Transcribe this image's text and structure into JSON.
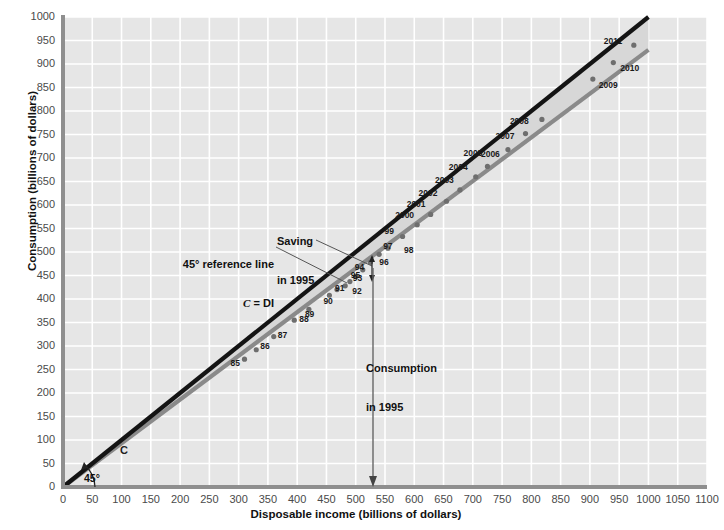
{
  "chart_data": {
    "type": "scatter",
    "title": "",
    "xlabel": "Disposable income (billions of dollars)",
    "ylabel": "Consumption (billions of dollars)",
    "xlim": [
      0,
      1100
    ],
    "ylim": [
      0,
      1000
    ],
    "xticks": [
      0,
      50,
      100,
      150,
      200,
      250,
      300,
      350,
      400,
      450,
      500,
      550,
      600,
      650,
      700,
      750,
      800,
      850,
      900,
      950,
      1000,
      1050,
      1100
    ],
    "yticks": [
      0,
      50,
      100,
      150,
      200,
      250,
      300,
      350,
      400,
      450,
      500,
      550,
      600,
      650,
      700,
      750,
      800,
      850,
      900,
      950,
      1000
    ],
    "grid": true,
    "legend_position": "none",
    "points": [
      {
        "label": "85",
        "x": 310,
        "y": 272
      },
      {
        "label": "86",
        "x": 330,
        "y": 292
      },
      {
        "label": "87",
        "x": 360,
        "y": 320
      },
      {
        "label": "88",
        "x": 395,
        "y": 355
      },
      {
        "label": "89",
        "x": 420,
        "y": 378
      },
      {
        "label": "90",
        "x": 455,
        "y": 408
      },
      {
        "label": "91",
        "x": 468,
        "y": 420
      },
      {
        "label": "92",
        "x": 482,
        "y": 428
      },
      {
        "label": "93",
        "x": 490,
        "y": 437
      },
      {
        "label": "94",
        "x": 500,
        "y": 448
      },
      {
        "label": "95",
        "x": 512,
        "y": 462
      },
      {
        "label": "96",
        "x": 525,
        "y": 478
      },
      {
        "label": "97",
        "x": 540,
        "y": 495
      },
      {
        "label": "98",
        "x": 555,
        "y": 508
      },
      {
        "label": "99",
        "x": 580,
        "y": 533
      },
      {
        "label": "2000",
        "x": 605,
        "y": 558
      },
      {
        "label": "2001",
        "x": 628,
        "y": 580
      },
      {
        "label": "2002",
        "x": 655,
        "y": 608
      },
      {
        "label": "2003",
        "x": 678,
        "y": 632
      },
      {
        "label": "2004",
        "x": 705,
        "y": 660
      },
      {
        "label": "2005",
        "x": 725,
        "y": 682
      },
      {
        "label": "2006",
        "x": 760,
        "y": 718
      },
      {
        "label": "2007",
        "x": 790,
        "y": 752
      },
      {
        "label": "2008",
        "x": 818,
        "y": 782
      },
      {
        "label": "2009",
        "x": 905,
        "y": 868
      },
      {
        "label": "2010",
        "x": 940,
        "y": 903
      },
      {
        "label": "2011",
        "x": 975,
        "y": 940
      }
    ],
    "series": [
      {
        "name": "45° reference line (C = DI)",
        "type": "line",
        "color": "#141414",
        "x": [
          0,
          1000
        ],
        "y": [
          0,
          1000
        ]
      },
      {
        "name": "C (consumption line)",
        "type": "line",
        "color": "#8a8a8a",
        "x": [
          0,
          1000
        ],
        "y": [
          0,
          930
        ]
      }
    ],
    "shaded_region": {
      "name": "saving-wedge",
      "color": "#d7d7d7",
      "between": [
        "45° reference line (C = DI)",
        "C (consumption line)"
      ]
    }
  },
  "annotations": {
    "reference_line": "45° reference line\nC = DI",
    "reference_line_l1": "45° reference line",
    "reference_line_l2": "C = DI",
    "saving": "Saving\nin 1995",
    "saving_l1": "Saving",
    "saving_l2": "in 1995",
    "consumption": "Consumption\nin 1995",
    "consumption_l1": "Consumption",
    "consumption_l2": "in 1995",
    "angle": "45°",
    "c_line_marker": "C"
  },
  "colors": {
    "plot_background": "#e6e6e6",
    "grid": "#ffffff",
    "axis": "#8f8f8f",
    "reference_line": "#141414",
    "consumption_line": "#8a8a8a",
    "point": "#6e6e6e",
    "wedge": "#d7d7d7",
    "text": "#111111",
    "tick_text": "#4a4a4a"
  }
}
